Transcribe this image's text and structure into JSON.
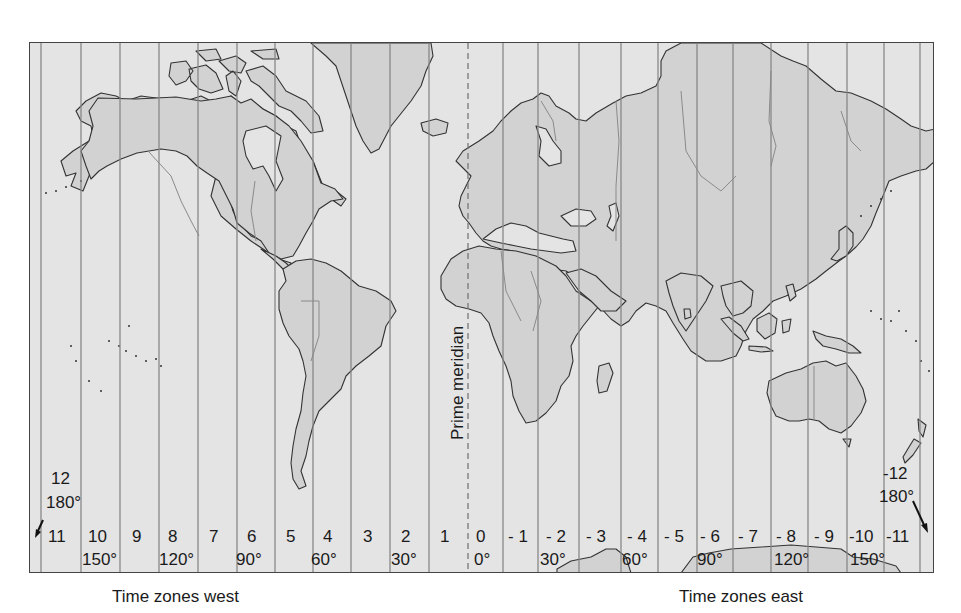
{
  "map": {
    "title": "World time zones",
    "colors": {
      "ocean": "#e4e4e4",
      "land": "#d2d2d2",
      "zone_line": "#888888",
      "coastline": "#333333",
      "frame": "#444444"
    },
    "prime_meridian_label": "Prime meridian",
    "dateline_west": {
      "zone": "12",
      "degrees": "180°"
    },
    "dateline_east": {
      "zone": "-12",
      "degrees": "180°"
    },
    "zones": [
      {
        "label": "11",
        "x": 48
      },
      {
        "label": "10",
        "x": 88
      },
      {
        "label": "9",
        "x": 132
      },
      {
        "label": "8",
        "x": 168
      },
      {
        "label": "7",
        "x": 209
      },
      {
        "label": "6",
        "x": 247
      },
      {
        "label": "5",
        "x": 286
      },
      {
        "label": "4",
        "x": 323
      },
      {
        "label": "3",
        "x": 363
      },
      {
        "label": "2",
        "x": 401
      },
      {
        "label": "1",
        "x": 440
      },
      {
        "label": "0",
        "x": 476
      },
      {
        "label": "- 1",
        "x": 508
      },
      {
        "label": "- 2",
        "x": 546
      },
      {
        "label": "- 3",
        "x": 586
      },
      {
        "label": "- 4",
        "x": 627
      },
      {
        "label": "- 5",
        "x": 664
      },
      {
        "label": "- 6",
        "x": 700
      },
      {
        "label": "- 7",
        "x": 738
      },
      {
        "label": "- 8",
        "x": 776
      },
      {
        "label": "- 9",
        "x": 814
      },
      {
        "label": "-10",
        "x": 849
      },
      {
        "label": "-11",
        "x": 886
      }
    ],
    "degrees": [
      {
        "label": "150°",
        "x": 82
      },
      {
        "label": "120°",
        "x": 159
      },
      {
        "label": "90°",
        "x": 236
      },
      {
        "label": "60°",
        "x": 311
      },
      {
        "label": "30°",
        "x": 391
      },
      {
        "label": "0°",
        "x": 474
      },
      {
        "label": "30°",
        "x": 540
      },
      {
        "label": "60°",
        "x": 622
      },
      {
        "label": "90°",
        "x": 697
      },
      {
        "label": "120°",
        "x": 774
      },
      {
        "label": "150°",
        "x": 850
      }
    ],
    "zone_lines_x": [
      40,
      80,
      119,
      158,
      197,
      236,
      274,
      312,
      350,
      389,
      428,
      502,
      537,
      578,
      620,
      657,
      696,
      732,
      770,
      807,
      846,
      883,
      919
    ],
    "prime_meridian_x": 467
  },
  "captions": {
    "west": "Time zones west",
    "east": "Time zones east"
  }
}
